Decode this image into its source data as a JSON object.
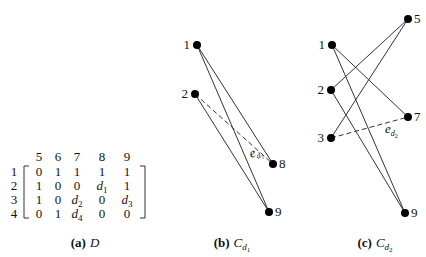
{
  "matrix": {
    "name": "D",
    "column_headers": [
      "5",
      "6",
      "7",
      "8",
      "9"
    ],
    "rows": [
      {
        "label": "1",
        "cells": [
          "0",
          "1",
          "1",
          "1",
          "1"
        ]
      },
      {
        "label": "2",
        "cells": [
          "1",
          "0",
          "0",
          "d1",
          "1"
        ]
      },
      {
        "label": "3",
        "cells": [
          "1",
          "0",
          "d2",
          "0",
          "d3"
        ]
      },
      {
        "label": "4",
        "cells": [
          "0",
          "1",
          "d4",
          "0",
          "0"
        ]
      }
    ],
    "caption": {
      "label": "(a)",
      "text": "D"
    }
  },
  "graph_b": {
    "caption": {
      "label": "(b)",
      "text": "C",
      "sub": "d1"
    },
    "nodes": [
      {
        "id": "1",
        "x": 197,
        "y": 45
      },
      {
        "id": "2",
        "x": 195,
        "y": 94
      },
      {
        "id": "8",
        "x": 273,
        "y": 164
      },
      {
        "id": "9",
        "x": 269,
        "y": 212
      }
    ],
    "edges": [
      [
        "1",
        "8"
      ],
      [
        "1",
        "9"
      ],
      [
        "2",
        "9"
      ]
    ],
    "dashed_edges": [
      [
        "2",
        "8"
      ]
    ],
    "edge_label": {
      "text": "e",
      "sub": "d1"
    }
  },
  "graph_c": {
    "caption": {
      "label": "(c)",
      "text": "C",
      "sub": "d2"
    },
    "nodes": [
      {
        "id": "1",
        "x": 332,
        "y": 45
      },
      {
        "id": "2",
        "x": 331,
        "y": 90
      },
      {
        "id": "3",
        "x": 331,
        "y": 138
      },
      {
        "id": "5",
        "x": 408,
        "y": 19
      },
      {
        "id": "7",
        "x": 408,
        "y": 117
      },
      {
        "id": "9",
        "x": 405,
        "y": 213
      }
    ],
    "edges": [
      [
        "1",
        "7"
      ],
      [
        "1",
        "9"
      ],
      [
        "2",
        "5"
      ],
      [
        "2",
        "9"
      ],
      [
        "3",
        "5"
      ]
    ],
    "dashed_edges": [
      [
        "3",
        "7"
      ]
    ],
    "edge_label": {
      "text": "e",
      "sub": "d2"
    }
  }
}
